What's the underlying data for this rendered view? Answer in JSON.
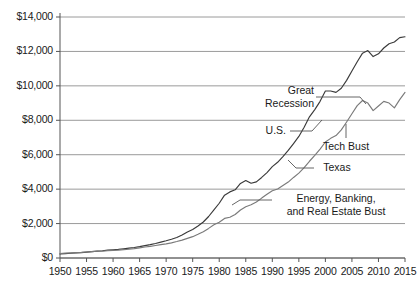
{
  "chart_data": {
    "type": "line",
    "title": "",
    "xlabel": "",
    "ylabel": "",
    "xlim": [
      1950,
      2015
    ],
    "ylim": [
      0,
      14000
    ],
    "grid": true,
    "legend_position": "inline-annotations",
    "y_tick_labels": [
      "$0",
      "$2,000",
      "$4,000",
      "$6,000",
      "$8,000",
      "$10,000",
      "$12,000",
      "$14,000"
    ],
    "y_tick_values": [
      0,
      2000,
      4000,
      6000,
      8000,
      10000,
      12000,
      14000
    ],
    "x_tick_labels": [
      "1950",
      "1955",
      "1960",
      "1965",
      "1970",
      "1975",
      "1980",
      "1985",
      "1990",
      "1995",
      "2000",
      "2005",
      "2010",
      "2015"
    ],
    "x_tick_values": [
      1950,
      1955,
      1960,
      1965,
      1970,
      1975,
      1980,
      1985,
      1990,
      1995,
      2000,
      2005,
      2010,
      2015
    ],
    "x": [
      1950,
      1951,
      1952,
      1953,
      1954,
      1955,
      1956,
      1957,
      1958,
      1959,
      1960,
      1961,
      1962,
      1963,
      1964,
      1965,
      1966,
      1967,
      1968,
      1969,
      1970,
      1971,
      1972,
      1973,
      1974,
      1975,
      1976,
      1977,
      1978,
      1979,
      1980,
      1981,
      1982,
      1983,
      1984,
      1985,
      1986,
      1987,
      1988,
      1989,
      1990,
      1991,
      1992,
      1993,
      1994,
      1995,
      1996,
      1997,
      1998,
      1999,
      2000,
      2001,
      2002,
      2003,
      2004,
      2005,
      2006,
      2007,
      2008,
      2009,
      2010,
      2011,
      2012,
      2013,
      2014,
      2015
    ],
    "series": [
      {
        "name": "Texas",
        "color": "#3a3a3a",
        "values": [
          230,
          255,
          275,
          295,
          310,
          340,
          370,
          400,
          420,
          455,
          480,
          500,
          535,
          570,
          610,
          660,
          720,
          775,
          845,
          925,
          1000,
          1085,
          1190,
          1330,
          1510,
          1660,
          1860,
          2090,
          2410,
          2790,
          3180,
          3650,
          3840,
          3960,
          4330,
          4500,
          4340,
          4420,
          4680,
          4960,
          5310,
          5560,
          5890,
          6250,
          6650,
          7060,
          7600,
          8200,
          8620,
          9100,
          9700,
          9700,
          9620,
          9860,
          10320,
          10860,
          11400,
          11900,
          12050,
          11700,
          11860,
          12200,
          12450,
          12550,
          12800,
          12850
        ]
      },
      {
        "name": "U.S.",
        "color": "#7a7a7a",
        "values": [
          260,
          280,
          295,
          315,
          325,
          350,
          370,
          390,
          395,
          425,
          440,
          455,
          485,
          510,
          545,
          590,
          640,
          675,
          725,
          775,
          820,
          880,
          955,
          1040,
          1140,
          1240,
          1380,
          1530,
          1720,
          1930,
          2080,
          2300,
          2370,
          2530,
          2790,
          2980,
          3090,
          3250,
          3480,
          3700,
          3910,
          4010,
          4210,
          4410,
          4680,
          4930,
          5250,
          5620,
          5960,
          6330,
          6740,
          6950,
          7110,
          7440,
          7900,
          8380,
          8850,
          9150,
          9000,
          8560,
          8830,
          9100,
          9000,
          8720,
          9200,
          9620
        ]
      }
    ],
    "annotations": [
      {
        "id": "great-recession",
        "text_lines": [
          "Great",
          "Recession"
        ],
        "series": "U.S.",
        "year": 2009
      },
      {
        "id": "us-label",
        "text_lines": [
          "U.S."
        ],
        "series": "U.S.",
        "year": 2002
      },
      {
        "id": "tech-bust",
        "text_lines": [
          "Tech Bust"
        ],
        "series": "both",
        "year": 2001
      },
      {
        "id": "texas-label",
        "text_lines": [
          "Texas"
        ],
        "series": "Texas",
        "year": 2000
      },
      {
        "id": "energy-bust",
        "text_lines": [
          "Energy, Banking,",
          "and Real Estate Bust"
        ],
        "series": "Texas",
        "year": 1987
      }
    ],
    "colors": {
      "grid": "#9a9a9a",
      "axis": "#555555",
      "text": "#1a1a1a",
      "texas_line": "#3a3a3a",
      "us_line": "#7a7a7a"
    }
  }
}
